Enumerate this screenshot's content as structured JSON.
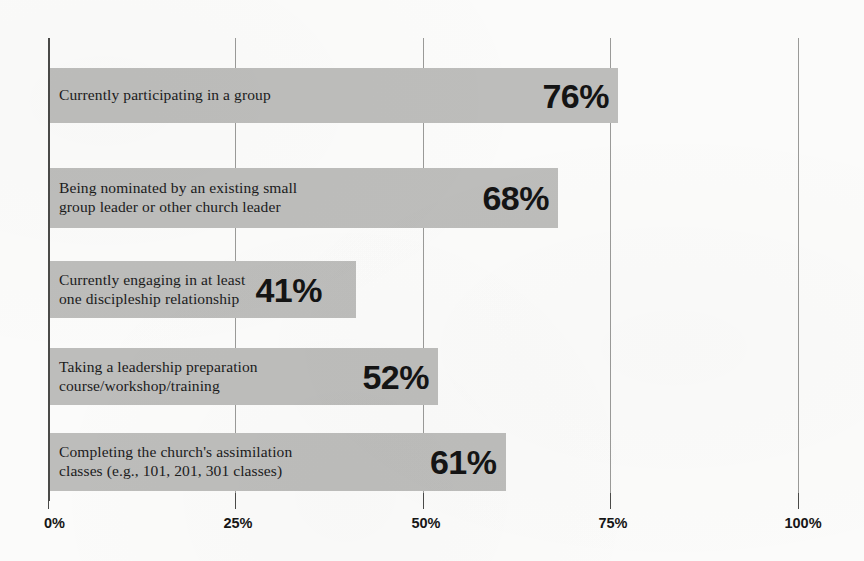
{
  "chart_data": {
    "type": "bar",
    "orientation": "horizontal",
    "title": "",
    "subtitle": "",
    "xlabel": "",
    "ylabel": "",
    "xlim": [
      0,
      100
    ],
    "grid": true,
    "legend": false,
    "value_suffix": "%",
    "categories": [
      "Currently participating in a group",
      "Being nominated by an existing small group leader or other church leader",
      "Currently engaging in at least one discipleship relationship",
      "Taking a leadership preparation course/workshop/training",
      "Completing the church's assimilation classes (e.g., 101, 201, 301 classes)"
    ],
    "values": [
      76,
      68,
      41,
      52,
      61
    ],
    "value_labels": [
      "76%",
      "68%",
      "41%",
      "52%",
      "61%"
    ],
    "tick_values": [
      0,
      25,
      50,
      75,
      100
    ],
    "tick_labels": [
      "0%",
      "25%",
      "50%",
      "75%",
      "100%"
    ],
    "colors": {
      "bar_fill": "#bdbdbb",
      "background": "#fbfbfa",
      "axis": "#4a4a48",
      "gridline": "#9a9a98",
      "label_text": "#1b1b1b",
      "value_text": "#141414"
    },
    "bars": [
      {
        "label_line1": "Currently participating in a group",
        "label_line2": "",
        "value": 76,
        "value_label": "76%"
      },
      {
        "label_line1": "Being nominated by an existing small",
        "label_line2": "group leader or other church leader",
        "value": 68,
        "value_label": "68%"
      },
      {
        "label_line1": "Currently engaging in at least",
        "label_line2": "one discipleship relationship",
        "value": 41,
        "value_label": "41%"
      },
      {
        "label_line1": "Taking a leadership preparation",
        "label_line2": "course/workshop/training",
        "value": 52,
        "value_label": "52%"
      },
      {
        "label_line1": "Completing the church's assimilation",
        "label_line2": "classes (e.g., 101, 201, 301 classes)",
        "value": 61,
        "value_label": "61%"
      }
    ]
  }
}
